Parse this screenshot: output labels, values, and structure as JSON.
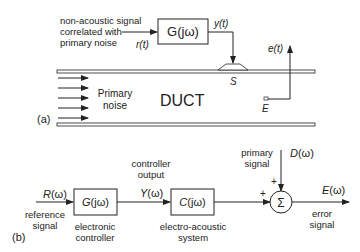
{
  "panel_a": {
    "label": "(a)",
    "source_note": [
      "non-acoustic signal",
      "correlated with",
      "primary noise"
    ],
    "r_label": "r(t)",
    "filter_label": "G(jω)",
    "y_label": "y(t)",
    "e_label": "e(t)",
    "speaker_label": "S",
    "mic_label": "E",
    "noise_label": [
      "Primary",
      "noise"
    ],
    "duct_label": "DUCT"
  },
  "panel_b": {
    "label": "(b)",
    "input_label": "R(ω)",
    "input_desc": [
      "reference",
      "signal"
    ],
    "controller_block": "G(jω)",
    "controller_desc": [
      "electronic",
      "controller"
    ],
    "output_desc": [
      "controller",
      "output"
    ],
    "y_label": "Y(ω)",
    "plant_block": "C(jω)",
    "plant_desc": [
      "electro-acoustic",
      "system"
    ],
    "disturbance_desc": [
      "primary",
      "signal"
    ],
    "d_label": "D(ω)",
    "plus_top": "+",
    "plus_left": "+",
    "sum_symbol": "Σ",
    "e_label": "E(ω)",
    "error_desc": [
      "error",
      "signal"
    ]
  }
}
